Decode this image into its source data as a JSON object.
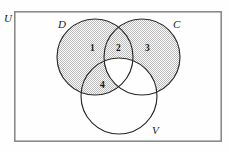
{
  "figure": {
    "kind": "venn-diagram",
    "width": 229,
    "height": 152,
    "background_color": "#fefefe",
    "shade_color": "#c9c9c9",
    "shade_style": "fine-checkerboard-dither",
    "outline_color": "#2a2a2a",
    "frame_color": "#8a8a8a"
  },
  "universe": {
    "label": "U",
    "frame": {
      "x": 14,
      "y": 11,
      "width": 208,
      "height": 131
    },
    "label_position": {
      "x": 5,
      "y": 21
    }
  },
  "sets": [
    {
      "id": "D",
      "label": "D",
      "cx": 95,
      "cy": 57,
      "r": 38,
      "shaded": true,
      "label_position": {
        "x": 58,
        "y": 28
      }
    },
    {
      "id": "C",
      "label": "C",
      "cx": 142,
      "cy": 57,
      "r": 38,
      "shaded": true,
      "label_position": {
        "x": 173,
        "y": 28
      }
    },
    {
      "id": "V",
      "label": "V",
      "cx": 119,
      "cy": 96,
      "r": 38,
      "shaded": false,
      "label_position": {
        "x": 152,
        "y": 134
      }
    }
  ],
  "regions": [
    {
      "number": "1",
      "description": "D only",
      "shaded": true,
      "position": {
        "x": 90,
        "y": 51
      }
    },
    {
      "number": "2",
      "description": "D and C, not V",
      "shaded": true,
      "position": {
        "x": 116,
        "y": 51
      }
    },
    {
      "number": "3",
      "description": "C only",
      "shaded": true,
      "position": {
        "x": 145,
        "y": 51
      }
    },
    {
      "number": "4",
      "description": "D and V, not C",
      "shaded": true,
      "position": {
        "x": 100,
        "y": 88
      }
    }
  ],
  "unshaded_regions": [
    "C and V, not D",
    "D and C and V",
    "V only",
    "outside all sets"
  ]
}
